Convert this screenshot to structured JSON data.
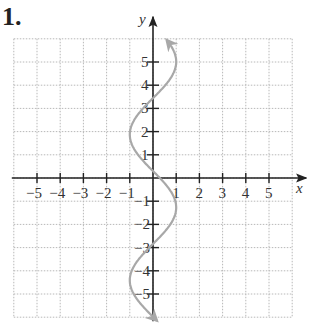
{
  "problem_number": "1.",
  "chart_data": {
    "type": "line",
    "title": "",
    "xlabel": "x",
    "ylabel": "y",
    "xlim": [
      -6,
      6
    ],
    "ylim": [
      -6,
      6
    ],
    "grid": true,
    "x_ticks": [
      -5,
      -4,
      -3,
      -2,
      -1,
      1,
      2,
      3,
      4,
      5
    ],
    "y_ticks": [
      -5,
      -4,
      -3,
      -2,
      -1,
      1,
      2,
      3,
      4,
      5
    ],
    "x_tick_labels": [
      "−5",
      "−4",
      "−3",
      "−2",
      "−1",
      "1",
      "2",
      "3",
      "4",
      "5"
    ],
    "y_tick_labels": [
      "−5",
      "−4",
      "−3",
      "−2",
      "−1",
      "1",
      "2",
      "3",
      "4",
      "5"
    ],
    "series": [
      {
        "name": "x = sin(y)",
        "description": "Sinusoidal curve oscillating horizontally between x=-1 and x=1 as y varies, with arrows at both ends",
        "color": "#a8a8a8",
        "points": [
          [
            -1.0,
            6.0
          ],
          [
            -0.5,
            5.5
          ],
          [
            0.0,
            5.0
          ],
          [
            0.6,
            4.6
          ],
          [
            1.0,
            3.9
          ],
          [
            0.8,
            3.0
          ],
          [
            0.0,
            2.2
          ],
          [
            -0.7,
            1.5
          ],
          [
            -1.0,
            0.6
          ],
          [
            -0.6,
            -0.2
          ],
          [
            0.0,
            -0.8
          ],
          [
            0.8,
            -1.6
          ],
          [
            1.0,
            -2.3
          ],
          [
            0.6,
            -3.1
          ],
          [
            0.0,
            -3.8
          ],
          [
            -0.7,
            -4.6
          ],
          [
            -1.0,
            -5.2
          ],
          [
            -0.8,
            -5.8
          ],
          [
            -0.5,
            -6.1
          ]
        ],
        "arrows": [
          "start",
          "end"
        ]
      }
    ],
    "legend": null
  },
  "colors": {
    "axis": "#222222",
    "grid": "#b8b8b8",
    "curve": "#a8a8a8"
  }
}
